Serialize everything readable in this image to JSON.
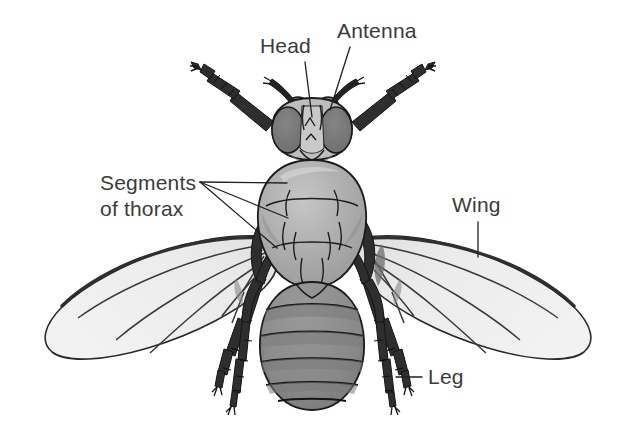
{
  "figure": {
    "background_color": "#ffffff",
    "view": "dorsal"
  },
  "labels": [
    {
      "id": "head",
      "text": "Head",
      "text_x": 260,
      "text_y": 53,
      "leader": "M 305,62 L 312,117",
      "anchor": "start"
    },
    {
      "id": "antenna",
      "text": "Antenna",
      "text_x": 337,
      "text_y": 38,
      "leader": "M 350,47 L 330,110",
      "anchor": "start"
    },
    {
      "id": "segments-of-thorax",
      "text_line1": "Segments",
      "text_line2": "of thorax",
      "text_x": 100,
      "text_y": 190,
      "text_y2": 216,
      "leader_1": "M 200,182 L 287,183",
      "leader_2": "M 200,182 L 288,218",
      "leader_3": "M 200,182 L 277,248",
      "anchor": "start"
    },
    {
      "id": "wing",
      "text": "Wing",
      "text_x": 452,
      "text_y": 212,
      "leader": "M 478,222 L 478,257",
      "anchor": "start"
    },
    {
      "id": "leg",
      "text": "Leg",
      "text_x": 428,
      "text_y": 384,
      "leader": "M 422,377 L 396,377",
      "anchor": "start"
    }
  ],
  "anatomy": {
    "head": {
      "name": "head",
      "fill": "#b9b9b9",
      "eye_fill": "#7a7a7a",
      "outline": "#1a1a1a"
    },
    "thorax": {
      "name": "thorax",
      "fill": "#a8a8a8",
      "highlight": "#c4c4c4",
      "outline": "#1a1a1a"
    },
    "abdomen": {
      "name": "abdomen",
      "fill": "#8c8c8c",
      "band_fill": "#7c7c7c",
      "segments": 6,
      "outline": "#1a1a1a"
    },
    "wings": {
      "name": "wing",
      "fill": "#ececec",
      "vein_color": "#2b2b2b",
      "count": 2
    },
    "legs": {
      "name": "leg",
      "fill": "#2e2e2e",
      "count": 6
    },
    "antennae": {
      "name": "antenna",
      "fill": "#1f1f1f",
      "count": 2
    }
  },
  "colors": {
    "text": "#3b3b3b",
    "line": "#202020",
    "background": "#ffffff"
  }
}
